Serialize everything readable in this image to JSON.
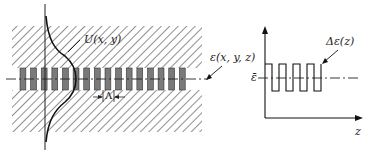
{
  "figure": {
    "left_panel": {
      "description": "Waveguide cross-section with periodic grating and guided mode profile",
      "mode_label": "U(x, y)",
      "permittivity_label": "ε(x, y, z)",
      "period_label": "Λ",
      "grating_periods": 16
    },
    "right_panel": {
      "description": "Periodic permittivity perturbation along z",
      "curve_label": "Δε(z)",
      "mean_label": "ε̄",
      "x_axis_label": "z",
      "square_wave_cycles": 4
    },
    "colors": {
      "line": "#1a1a1a",
      "hatch": "#444444",
      "grating_dark": "#7a7a7a",
      "background": "#ffffff"
    }
  }
}
